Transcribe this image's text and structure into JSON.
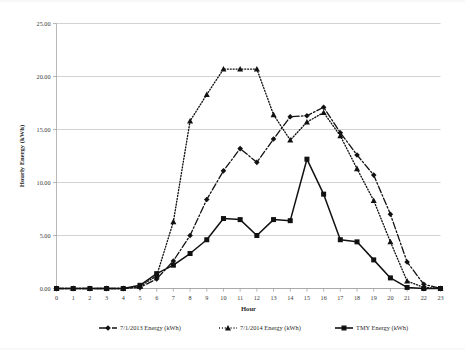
{
  "chart_data": {
    "type": "line",
    "title": "",
    "xlabel": "Hour",
    "ylabel": "Hourly Energy (kWh)",
    "xlim": [
      0,
      23
    ],
    "ylim": [
      0,
      25
    ],
    "grid": true,
    "legend_position": "bottom",
    "x": [
      0,
      1,
      2,
      3,
      4,
      5,
      6,
      7,
      8,
      9,
      10,
      11,
      12,
      13,
      14,
      15,
      16,
      17,
      18,
      19,
      20,
      21,
      22,
      23
    ],
    "xtick_labels": [
      "0",
      "1",
      "2",
      "3",
      "4",
      "5",
      "6",
      "7",
      "8",
      "9",
      "10",
      "11",
      "12",
      "13",
      "14",
      "15",
      "16",
      "17",
      "18",
      "19",
      "20",
      "21",
      "22",
      "23"
    ],
    "ytick_labels": [
      "0.00",
      "5.00",
      "10.00",
      "15.00",
      "20.00",
      "25.00"
    ],
    "ytick_values": [
      0,
      5,
      10,
      15,
      20,
      25
    ],
    "series": [
      {
        "name": "7/1/2013 Energy (kWh)",
        "marker": "diamond",
        "dash": "dashdot",
        "values": [
          0.0,
          0.0,
          0.0,
          0.0,
          0.0,
          0.1,
          0.9,
          2.6,
          5.0,
          8.4,
          11.1,
          13.2,
          11.9,
          14.1,
          16.2,
          16.3,
          17.1,
          14.7,
          12.6,
          10.7,
          7.0,
          2.5,
          0.4,
          0.0
        ]
      },
      {
        "name": "7/1/2014 Energy (kWh)",
        "marker": "triangle",
        "dash": "dotted",
        "values": [
          0.0,
          0.0,
          0.0,
          0.0,
          0.0,
          0.2,
          1.2,
          6.3,
          15.8,
          18.3,
          20.7,
          20.7,
          20.7,
          16.4,
          14.0,
          15.7,
          16.6,
          14.4,
          11.3,
          8.3,
          4.4,
          0.7,
          0.1,
          0.0
        ]
      },
      {
        "name": "TMY Energy (kWh)",
        "marker": "square",
        "dash": "solid",
        "values": [
          0.0,
          0.0,
          0.0,
          0.0,
          0.0,
          0.3,
          1.4,
          2.2,
          3.3,
          4.6,
          6.6,
          6.5,
          5.0,
          6.5,
          6.4,
          12.2,
          8.9,
          4.6,
          4.4,
          2.7,
          1.0,
          0.1,
          0.0,
          0.0
        ]
      }
    ]
  },
  "axes": {
    "x_title": "Hour",
    "y_title": "Hourly Energy (kWh)"
  },
  "legend": {
    "items": [
      {
        "label": "7/1/2013 Energy (kWh)"
      },
      {
        "label": "7/1/2014 Energy (kWh)"
      },
      {
        "label": "TMY Energy (kWh)"
      }
    ]
  },
  "colors": {
    "ink": "#1a1a1a",
    "grid": "#b4b4b4",
    "axis": "#9a9a9a",
    "background": "#ffffff"
  }
}
